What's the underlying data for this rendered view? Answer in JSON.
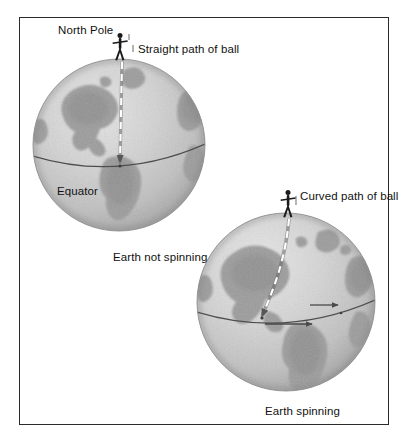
{
  "figure": {
    "background_color": "#ffffff",
    "frame_color": "#2b2b2b"
  },
  "labels": {
    "north_pole": "North Pole",
    "straight_path": "Straight path of ball",
    "equator": "Equator",
    "earth_not_spinning": "Earth not spinning",
    "curved_path": "Curved path of ball",
    "earth_spinning": "Earth spinning"
  },
  "globes": [
    {
      "id": "globe-not-spinning",
      "caption": "Earth not spinning",
      "center_x": 119,
      "center_y": 145,
      "radius": 86,
      "equator_label": "Equator",
      "equator_y": 160,
      "path_label": "Straight path of ball",
      "path_type": "straight",
      "spin_arrows": 0,
      "figure_present": true,
      "ocean_color": "#cfcfcf",
      "land_color": "#9a9a9a",
      "outline_color": "#6e6e6e"
    },
    {
      "id": "globe-spinning",
      "caption": "Earth spinning",
      "center_x": 286,
      "center_y": 302,
      "radius": 89,
      "equator_label": "",
      "equator_y": 318,
      "path_label": "Curved path of ball",
      "path_type": "curved",
      "spin_arrows": 2,
      "figure_present": true,
      "ocean_color": "#cfcfcf",
      "land_color": "#9a9a9a",
      "outline_color": "#6e6e6e"
    }
  ],
  "icons": {
    "person": "person-silhouette-icon",
    "spin_arrow": "rotation-arrow-icon",
    "ball_path": "dashed-path-icon"
  },
  "colors": {
    "text": "#111111",
    "frame": "#2b2b2b",
    "path_dash": "#ffffff",
    "path_dash_outline": "#5a5a5a",
    "arrow": "#4a4a4a",
    "equator_line": "#4d4d4d",
    "person": "#1a1a1a"
  }
}
